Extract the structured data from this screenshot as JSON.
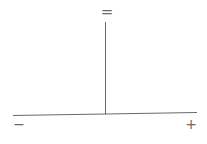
{
  "diagram": {
    "type": "balance-axis",
    "labels": {
      "top": "=",
      "left": "−",
      "right": "+"
    },
    "line_color": "#6a6a6a",
    "background": "#ffffff"
  }
}
